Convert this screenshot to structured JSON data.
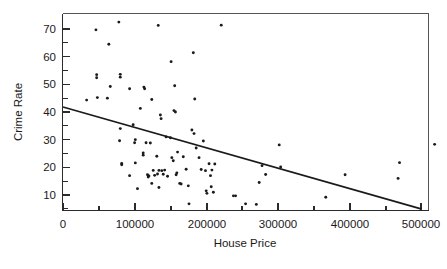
{
  "chart_data": {
    "type": "scatter",
    "title": "",
    "xlabel": "House Price",
    "ylabel": "Crime Rate",
    "xlim": [
      0,
      530000
    ],
    "ylim": [
      5,
      75
    ],
    "grid": false,
    "legend": null,
    "x_ticks": [
      0,
      100000,
      200000,
      300000,
      400000,
      500000
    ],
    "x_tick_labels": [
      "0",
      "100000",
      "200000",
      "300000",
      "400000",
      "500000"
    ],
    "x_minor_ticks": [
      50000,
      150000,
      250000,
      350000,
      450000
    ],
    "y_ticks": [
      10,
      20,
      30,
      40,
      50,
      60,
      70
    ],
    "y_tick_labels": [
      "10",
      "20",
      "30",
      "40",
      "50",
      "60",
      "70"
    ],
    "y_minor_ticks": [
      15,
      25,
      35,
      45,
      55,
      65
    ],
    "marker": "dot",
    "marker_color": "#1a1a1a",
    "points": [
      [
        33000,
        44.3
      ],
      [
        46000,
        69.7
      ],
      [
        47000,
        53.5
      ],
      [
        47000,
        52.4
      ],
      [
        48000,
        45.2
      ],
      [
        62000,
        45.0
      ],
      [
        64000,
        64.5
      ],
      [
        66000,
        49.2
      ],
      [
        78000,
        72.5
      ],
      [
        80000,
        53.6
      ],
      [
        80000,
        52.6
      ],
      [
        80000,
        34.0
      ],
      [
        79000,
        29.6
      ],
      [
        82000,
        21.4
      ],
      [
        82000,
        20.9
      ],
      [
        93000,
        48.4
      ],
      [
        93000,
        17.0
      ],
      [
        98000,
        35.4
      ],
      [
        100000,
        28.9
      ],
      [
        101000,
        30.0
      ],
      [
        101000,
        21.6
      ],
      [
        104000,
        12.3
      ],
      [
        108000,
        41.3
      ],
      [
        112000,
        25.2
      ],
      [
        112000,
        24.4
      ],
      [
        113000,
        49.0
      ],
      [
        114000,
        48.4
      ],
      [
        116000,
        28.9
      ],
      [
        118000,
        17.3
      ],
      [
        119000,
        16.5
      ],
      [
        120000,
        16.9
      ],
      [
        122000,
        28.8
      ],
      [
        124000,
        44.5
      ],
      [
        124000,
        14.2
      ],
      [
        126000,
        18.9
      ],
      [
        128000,
        17.1
      ],
      [
        131000,
        24.0
      ],
      [
        132000,
        17.6
      ],
      [
        133000,
        71.3
      ],
      [
        134000,
        18.9
      ],
      [
        134000,
        12.7
      ],
      [
        136000,
        38.9
      ],
      [
        137000,
        37.6
      ],
      [
        138000,
        18.8
      ],
      [
        140000,
        17.5
      ],
      [
        142000,
        19.0
      ],
      [
        144000,
        31.0
      ],
      [
        146000,
        16.8
      ],
      [
        150000,
        30.7
      ],
      [
        151000,
        58.2
      ],
      [
        152000,
        23.5
      ],
      [
        154000,
        22.4
      ],
      [
        155000,
        40.5
      ],
      [
        156000,
        49.5
      ],
      [
        157000,
        40.0
      ],
      [
        158000,
        17.3
      ],
      [
        159000,
        18.0
      ],
      [
        160000,
        25.5
      ],
      [
        163000,
        14.2
      ],
      [
        165000,
        14.0
      ],
      [
        168000,
        23.8
      ],
      [
        172000,
        19.3
      ],
      [
        175000,
        13.3
      ],
      [
        176000,
        6.8
      ],
      [
        180000,
        33.5
      ],
      [
        182000,
        61.4
      ],
      [
        183000,
        32.2
      ],
      [
        184000,
        44.7
      ],
      [
        186000,
        27.0
      ],
      [
        190000,
        23.5
      ],
      [
        193000,
        19.2
      ],
      [
        196000,
        29.5
      ],
      [
        199000,
        18.8
      ],
      [
        200000,
        11.5
      ],
      [
        201000,
        10.6
      ],
      [
        204000,
        21.3
      ],
      [
        206000,
        17.0
      ],
      [
        207000,
        13.0
      ],
      [
        208000,
        19.0
      ],
      [
        210000,
        11.0
      ],
      [
        212000,
        21.2
      ],
      [
        221000,
        71.4
      ],
      [
        238000,
        9.7
      ],
      [
        241000,
        9.7
      ],
      [
        255000,
        6.8
      ],
      [
        270000,
        6.6
      ],
      [
        274000,
        14.5
      ],
      [
        278000,
        20.6
      ],
      [
        283000,
        17.4
      ],
      [
        302000,
        28.1
      ],
      [
        304000,
        20.1
      ],
      [
        367000,
        9.2
      ],
      [
        394000,
        17.3
      ],
      [
        468000,
        16.0
      ],
      [
        470000,
        21.7
      ],
      [
        519000,
        28.3
      ]
    ],
    "trendline": {
      "type": "linear",
      "x_start": 0,
      "y_start": 41.8,
      "x_end": 500000,
      "y_end": 5.0,
      "slope_per_100000": -7.36,
      "intercept": 41.8
    }
  },
  "figure": {
    "background_color": "#ffffff",
    "axis_color": "#2b2b2b",
    "frame_color": "#555555",
    "marker_color": "#1a1a1a",
    "trend_color": "#1a1a1a"
  }
}
